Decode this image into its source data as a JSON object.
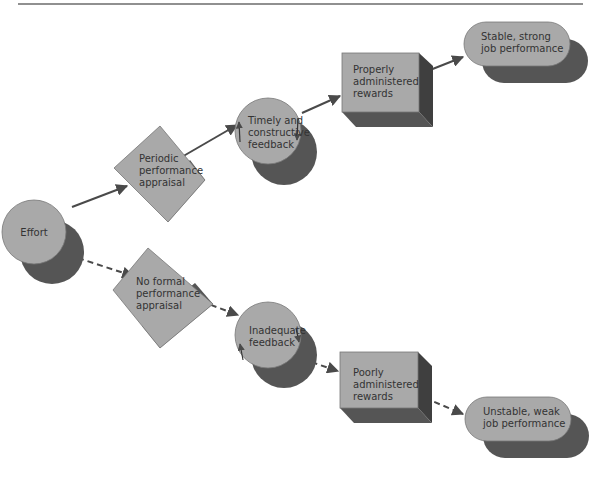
{
  "diagram": {
    "title": "",
    "colors": {
      "face": "#a9a9a9",
      "shadow": "#555555",
      "arrow": "#4a4a4a",
      "rule": "#222222",
      "text": "#333333"
    },
    "nodes": {
      "effort": {
        "label_lines": [
          "Effort"
        ],
        "shape": "circle"
      },
      "periodic": {
        "label_lines": [
          "Periodic",
          "performance",
          "appraisal"
        ],
        "shape": "diamond"
      },
      "no_formal": {
        "label_lines": [
          "No formal",
          "performance",
          "appraisal"
        ],
        "shape": "diamond"
      },
      "timely": {
        "label_lines": [
          "Timely and",
          "constructive",
          "feedback"
        ],
        "shape": "circle"
      },
      "inadequate": {
        "label_lines": [
          "Inadequate",
          "feedback"
        ],
        "shape": "circle"
      },
      "properly": {
        "label_lines": [
          "Properly",
          "administered",
          "rewards"
        ],
        "shape": "box"
      },
      "poorly": {
        "label_lines": [
          "Poorly",
          "administered",
          "rewards"
        ],
        "shape": "box"
      },
      "stable": {
        "label_lines": [
          "Stable, strong",
          "job performance"
        ],
        "shape": "pill"
      },
      "unstable": {
        "label_lines": [
          "Unstable, weak",
          "job performance"
        ],
        "shape": "pill"
      }
    },
    "edges": [
      {
        "from": "effort",
        "to": "periodic",
        "style": "solid"
      },
      {
        "from": "periodic",
        "to": "timely",
        "style": "solid"
      },
      {
        "from": "timely",
        "to": "properly",
        "style": "solid"
      },
      {
        "from": "properly",
        "to": "stable",
        "style": "solid"
      },
      {
        "from": "effort",
        "to": "no_formal",
        "style": "dashed"
      },
      {
        "from": "no_formal",
        "to": "inadequate",
        "style": "dashed"
      },
      {
        "from": "inadequate",
        "to": "poorly",
        "style": "dashed"
      },
      {
        "from": "poorly",
        "to": "unstable",
        "style": "dashed"
      }
    ]
  }
}
